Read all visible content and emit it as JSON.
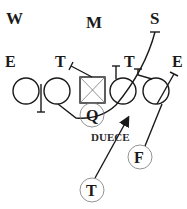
{
  "diagram": {
    "title": "DUECE",
    "defense_labels": {
      "will": "W",
      "mike": "M",
      "sam": "S",
      "left_end": "E",
      "left_tackle": "T",
      "right_tackle": "T",
      "right_end": "E"
    },
    "offense_labels": {
      "quarterback": "Q",
      "fullback": "F",
      "tailback": "T"
    },
    "play_name": "DUECE",
    "colors": {
      "line": "#1a1a1a",
      "center_x": "#777777",
      "background": "#ffffff"
    }
  }
}
